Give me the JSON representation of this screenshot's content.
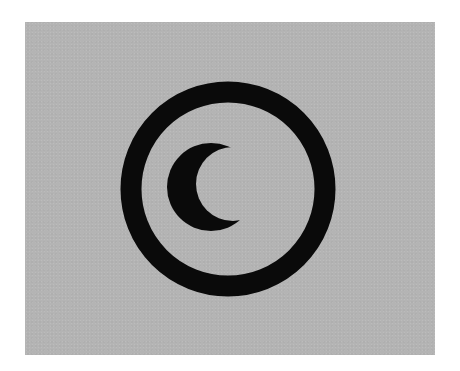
{
  "figure": {
    "icon": "crescent-moon-in-circle-icon",
    "colors": {
      "page_background": "#ffffff",
      "panel_background": "#b4b4b4",
      "symbol": "#0a0a0a"
    },
    "panel": {
      "x": 25,
      "y": 22,
      "width": 410,
      "height": 333
    },
    "ring": {
      "cx": 228,
      "cy": 189,
      "r": 97,
      "stroke_width": 21
    },
    "crescent": {
      "outer": {
        "cx": 211,
        "cy": 187,
        "r": 44
      },
      "inner_cut": {
        "cx": 232,
        "cy": 185,
        "r": 36
      }
    }
  }
}
